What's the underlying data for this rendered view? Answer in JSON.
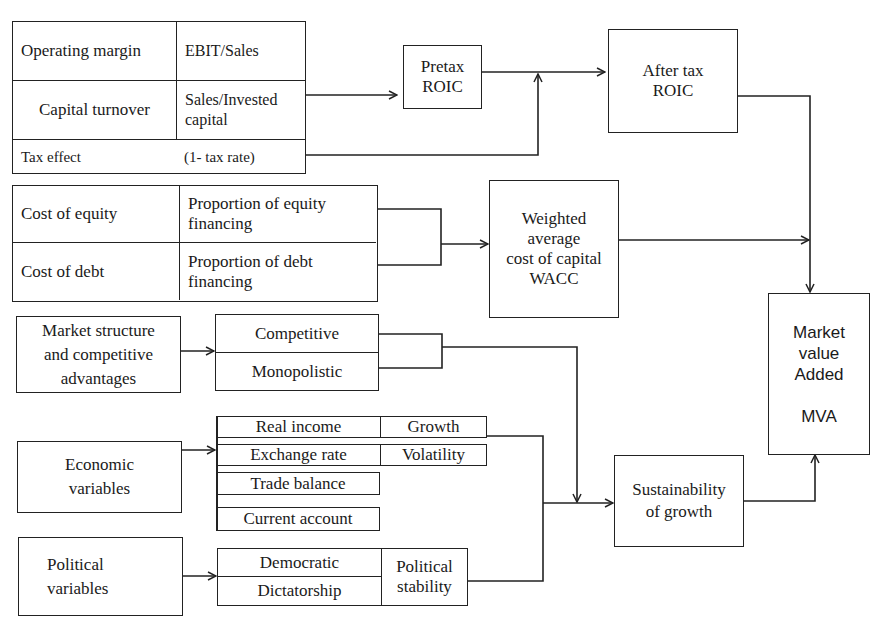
{
  "diagram": {
    "title": "",
    "profitability_table": {
      "rows": [
        {
          "label": "Operating margin",
          "value": "EBIT/Sales"
        },
        {
          "label": "Capital turnover",
          "value": "Sales/Invested\ncapital"
        },
        {
          "label": "Tax effect",
          "value": "(1- tax rate)"
        }
      ]
    },
    "pretax_roic": "Pretax\nROIC",
    "after_tax_roic": "After tax\nROIC",
    "financing_table": {
      "rows": [
        {
          "label": "Cost of equity",
          "value": "Proportion  of equity\nfinancing"
        },
        {
          "label": "Cost of debt",
          "value": "Proportion of debt\nfinancing"
        }
      ]
    },
    "wacc": "Weighted\naverage\ncost of capital\nWACC",
    "market_structure": "Market structure\nand competitive\nadvantages",
    "market_types": [
      "Competitive",
      "Monopolistic"
    ],
    "economic_variables": "Economic\nvariables",
    "economic_items": [
      {
        "label": "Real income",
        "value": "Growth"
      },
      {
        "label": "Exchange rate",
        "value": "Volatility"
      },
      {
        "label": "Trade balance",
        "value": ""
      },
      {
        "label": "Current account",
        "value": ""
      }
    ],
    "political_variables": "Political\nvariables",
    "political_types": [
      "Democratic",
      "Dictatorship"
    ],
    "political_stability": "Political\nstability",
    "sustainability": "Sustainability\nof growth",
    "mva": "Market\nvalue\nAdded\n\nMVA"
  },
  "colors": {
    "line": "#222222",
    "background": "#ffffff"
  }
}
